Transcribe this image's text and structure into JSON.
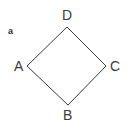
{
  "figure": {
    "tag": "a",
    "shape_name": "rhombus-quadrilateral",
    "background_color": "#ffffff",
    "stroke_color": "#3a3a3a",
    "stroke_width": 1,
    "label_color": "#3a3a3a",
    "vertices": [
      {
        "id": "D",
        "label": "D",
        "x": 67,
        "y": 27,
        "label_position": "above"
      },
      {
        "id": "C",
        "label": "C",
        "x": 106,
        "y": 66,
        "label_position": "right"
      },
      {
        "id": "B",
        "label": "B",
        "x": 68,
        "y": 105,
        "label_position": "below"
      },
      {
        "id": "A",
        "label": "A",
        "x": 27,
        "y": 66,
        "label_position": "left"
      }
    ],
    "edges": [
      {
        "from": "D",
        "to": "C"
      },
      {
        "from": "C",
        "to": "B"
      },
      {
        "from": "B",
        "to": "A"
      },
      {
        "from": "A",
        "to": "D"
      }
    ],
    "polygon_points": "67,27 106,66 68,105 27,66"
  }
}
